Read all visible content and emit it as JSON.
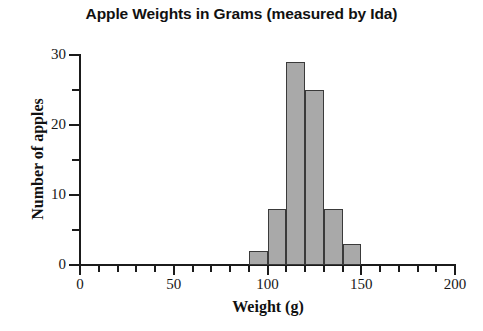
{
  "chart_data": {
    "type": "bar",
    "title": "Apple Weights in Grams (measured by Ida)",
    "xlabel": "Weight (g)",
    "ylabel": "Number of apples",
    "grid": false,
    "legend": "none",
    "bin_width": 10,
    "bin_edges": [
      90,
      100,
      110,
      120,
      130,
      140,
      150
    ],
    "categories": [
      "90-100",
      "100-110",
      "110-120",
      "120-130",
      "130-140",
      "140-150"
    ],
    "values": [
      2,
      8,
      29,
      25,
      8,
      3
    ],
    "xlim": [
      0,
      200
    ],
    "ylim": [
      0,
      30
    ],
    "x_major_ticks": [
      0,
      50,
      100,
      150,
      200
    ],
    "x_major_tick_labels": [
      "0",
      "50",
      "100",
      "150",
      "200"
    ],
    "x_minor_tick_step": 10,
    "y_major_ticks": [
      0,
      10,
      20,
      30
    ],
    "y_major_tick_labels": [
      "0",
      "10",
      "20",
      "30"
    ],
    "y_minor_ticks": [
      5,
      15,
      25
    ],
    "bar_fill_color": "#a9a9a9",
    "bar_edge_color": "#3a3a3a",
    "axis_color": "#1b1b1b",
    "background_color": "#ffffff"
  }
}
